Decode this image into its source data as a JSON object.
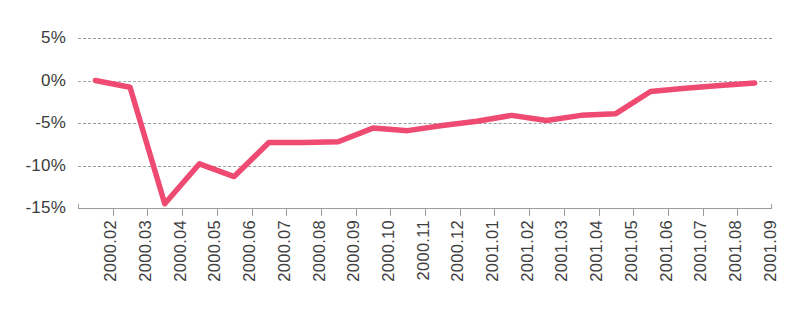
{
  "chart_data": {
    "type": "line",
    "title": "",
    "subtitle": "",
    "xlabel": "",
    "ylabel": "",
    "grid": true,
    "legend_position": "none",
    "ylim": [
      -15,
      5
    ],
    "ytick_labels": [
      "5%",
      "0%",
      "-5%",
      "-10%",
      "-15%"
    ],
    "ytick_values": [
      5,
      0,
      -5,
      -10,
      -15
    ],
    "value_suffix": "%",
    "categories": [
      "2000.02",
      "2000.03",
      "2000.04",
      "2000.05",
      "2000.06",
      "2000.07",
      "2000.08",
      "2000.09",
      "2000.10",
      "2000.11",
      "2000.12",
      "2001.01",
      "2001.02",
      "2001.03",
      "2001.04",
      "2001.05",
      "2001.06",
      "2001.07",
      "2001.08",
      "2001.09"
    ],
    "series": [
      {
        "name": "Series 1",
        "color": "#ee4a72",
        "values": [
          0.0,
          -0.8,
          -14.5,
          -9.8,
          -11.3,
          -7.3,
          -7.3,
          -7.2,
          -5.6,
          -5.9,
          -5.3,
          -4.8,
          -4.1,
          -4.7,
          -4.1,
          -3.9,
          -1.3,
          -0.9,
          -0.6,
          -0.3
        ]
      }
    ]
  },
  "colors": {
    "series_line": "#ee4a72",
    "gridline": "#8a8a8a",
    "axis": "#9c9c9c",
    "tick_text": "#3b3b3b",
    "background": "#ffffff"
  }
}
